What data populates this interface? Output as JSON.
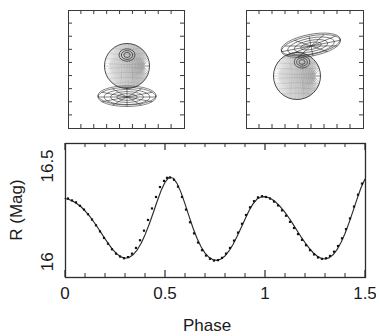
{
  "figure": {
    "kind": "astronomy-binary-star-light-curve",
    "panels": {
      "model_left": {
        "name": "binary-model-phase-a",
        "description": "3D Roche geometry model: shaded spherical star above a flattened elliptical accretion disk seen nearly edge-on",
        "frame": {
          "x": 68,
          "y": 10,
          "width": 116,
          "height": 118
        },
        "sphere": {
          "cx": 127,
          "cy": 66,
          "r": 22.5,
          "hotspot_cx": 127,
          "hotspot_cy": 55,
          "hotspot_rings": [
            3.2,
            5.6,
            8.0
          ]
        },
        "disk": {
          "cx": 127,
          "cy": 97,
          "rx": 29,
          "ry": 9.5,
          "tilt_deg": 0,
          "spokes": 6
        }
      },
      "model_right": {
        "name": "binary-model-phase-b",
        "description": "Same system rotated: tilted disk displaced up and to the right, partially overlapping the shaded star",
        "frame": {
          "x": 246,
          "y": 10,
          "width": 117,
          "height": 118
        },
        "sphere": {
          "cx": 297,
          "cy": 76,
          "r": 23.5,
          "hotspot_cx": 302,
          "hotspot_cy": 62,
          "hotspot_rings": [
            3.0,
            5.4,
            7.8
          ]
        },
        "disk": {
          "cx": 311,
          "cy": 46,
          "rx": 30,
          "ry": 10,
          "tilt_deg": -11,
          "spokes": 6
        }
      }
    }
  },
  "plot": {
    "frame": {
      "x": 65,
      "y": 143,
      "width": 300,
      "height": 134
    }
  },
  "chart_data": {
    "type": "line",
    "title": "",
    "xlabel": "Phase",
    "ylabel": "R (Mag)",
    "xlim": [
      0.0,
      1.5
    ],
    "ylim": [
      16.62,
      15.92
    ],
    "y_inverted": true,
    "grid": false,
    "legend": null,
    "x_ticks": [
      0,
      0.5,
      1,
      1.5
    ],
    "x_tick_labels": [
      "0",
      "0.5",
      "1",
      "1.5"
    ],
    "x_minor_step": 0.1,
    "y_ticks": [
      16,
      16.5
    ],
    "y_tick_labels": [
      "16",
      "16.5"
    ],
    "y_minor_step": 0.1,
    "series": [
      {
        "name": "model-fit",
        "style": "solid-line",
        "x": [
          0.0,
          0.02,
          0.04,
          0.06,
          0.08,
          0.1,
          0.12,
          0.14,
          0.16,
          0.18,
          0.2,
          0.22,
          0.24,
          0.26,
          0.28,
          0.3,
          0.32,
          0.34,
          0.36,
          0.38,
          0.4,
          0.42,
          0.44,
          0.46,
          0.48,
          0.5,
          0.52,
          0.54,
          0.56,
          0.58,
          0.6,
          0.62,
          0.64,
          0.66,
          0.68,
          0.7,
          0.72,
          0.74,
          0.76,
          0.78,
          0.8,
          0.82,
          0.84,
          0.86,
          0.88,
          0.9,
          0.92,
          0.94,
          0.96,
          0.98,
          1.0,
          1.02,
          1.04,
          1.06,
          1.08,
          1.1,
          1.12,
          1.14,
          1.16,
          1.18,
          1.2,
          1.22,
          1.24,
          1.26,
          1.28,
          1.3,
          1.32,
          1.34,
          1.36,
          1.38,
          1.4,
          1.42,
          1.44,
          1.46,
          1.48,
          1.5
        ],
        "y": [
          16.33,
          16.325,
          16.316,
          16.303,
          16.287,
          16.266,
          16.242,
          16.214,
          16.184,
          16.152,
          16.12,
          16.089,
          16.062,
          16.04,
          16.025,
          16.018,
          16.022,
          16.036,
          16.06,
          16.095,
          16.14,
          16.193,
          16.252,
          16.313,
          16.37,
          16.415,
          16.44,
          16.437,
          16.409,
          16.362,
          16.302,
          16.238,
          16.176,
          16.122,
          16.078,
          16.045,
          16.023,
          16.01,
          16.007,
          16.014,
          16.03,
          16.056,
          16.09,
          16.131,
          16.176,
          16.222,
          16.266,
          16.302,
          16.327,
          16.338,
          16.34,
          16.334,
          16.322,
          16.305,
          16.283,
          16.258,
          16.228,
          16.196,
          16.163,
          16.13,
          16.1,
          16.072,
          16.048,
          16.03,
          16.018,
          16.014,
          16.02,
          16.036,
          16.063,
          16.1,
          16.147,
          16.203,
          16.264,
          16.327,
          16.386,
          16.432
        ]
      },
      {
        "name": "observed-photometry",
        "style": "points",
        "marker": "small-filled-square",
        "x": [
          0.015,
          0.035,
          0.055,
          0.075,
          0.095,
          0.115,
          0.135,
          0.155,
          0.175,
          0.195,
          0.215,
          0.235,
          0.255,
          0.275,
          0.295,
          0.315,
          0.335,
          0.355,
          0.375,
          0.395,
          0.415,
          0.435,
          0.455,
          0.475,
          0.495,
          0.51,
          0.525,
          0.545,
          0.565,
          0.585,
          0.605,
          0.625,
          0.645,
          0.665,
          0.685,
          0.705,
          0.725,
          0.745,
          0.765,
          0.785,
          0.805,
          0.825,
          0.845,
          0.865,
          0.885,
          0.905,
          0.925,
          0.945,
          0.965,
          0.985,
          1.005,
          1.025,
          1.045,
          1.065,
          1.085,
          1.105,
          1.125,
          1.145,
          1.165,
          1.185,
          1.205,
          1.225,
          1.245,
          1.265,
          1.285,
          1.305,
          1.325,
          1.345,
          1.365,
          1.385,
          1.405,
          1.425,
          1.445,
          1.465,
          1.485
        ],
        "y": [
          16.33,
          16.32,
          16.31,
          16.292,
          16.272,
          16.248,
          16.22,
          16.19,
          16.158,
          16.124,
          16.094,
          16.065,
          16.042,
          16.027,
          16.018,
          16.024,
          16.042,
          16.072,
          16.112,
          16.162,
          16.218,
          16.278,
          16.338,
          16.39,
          16.422,
          16.438,
          16.44,
          16.428,
          16.392,
          16.338,
          16.272,
          16.206,
          16.148,
          16.1,
          16.06,
          16.032,
          16.015,
          16.006,
          16.008,
          16.02,
          16.042,
          16.072,
          16.11,
          16.152,
          16.198,
          16.244,
          16.284,
          16.316,
          16.336,
          16.342,
          16.338,
          16.33,
          16.314,
          16.294,
          16.268,
          16.24,
          16.208,
          16.176,
          16.144,
          16.114,
          16.086,
          16.06,
          16.038,
          16.022,
          16.015,
          16.018,
          16.03,
          16.052,
          16.082,
          16.122,
          16.17,
          16.226,
          16.288,
          16.35,
          16.408
        ]
      }
    ],
    "annotations": {
      "max_1_phase": 0.28,
      "max_1_mag": 16.018,
      "max_2_phase": 0.77,
      "max_2_mag": 16.007,
      "min_primary_phase": 0.51,
      "min_primary_mag": 16.44,
      "min_secondary_phase": 0.99,
      "min_secondary_mag": 16.342
    }
  },
  "colors": {
    "background": "#ffffff",
    "ink": "#1a1a1a",
    "axis": "#2b2b2b",
    "curve": "#2b2b2b",
    "point": "#111111",
    "panel_frame": "#3a3a3a"
  }
}
